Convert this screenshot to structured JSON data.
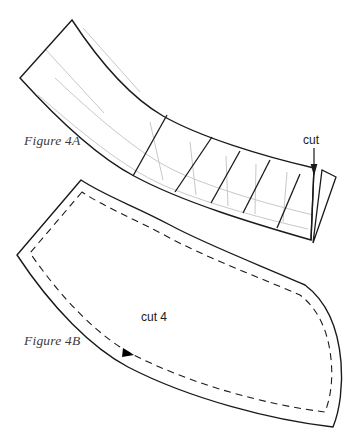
{
  "figure_a": {
    "label": "Figure 4A",
    "annotation_cut": "cut",
    "description": "segmented curved band with construction gridlines",
    "colors": {
      "outline": "#1a1a1a",
      "segment_divider": "#1a1a1a",
      "gridline": "#c8c8c8"
    }
  },
  "figure_b": {
    "label": "Figure 4B",
    "annotation_cut_count": "cut 4",
    "description": "smoothed pattern piece with dashed seam allowance and notch marker",
    "colors": {
      "outline": "#1a1a1a",
      "seam_dashed": "#1a1a1a",
      "notch": "#000000"
    }
  },
  "page": {
    "background": "#ffffff",
    "width": 354,
    "height": 441
  }
}
